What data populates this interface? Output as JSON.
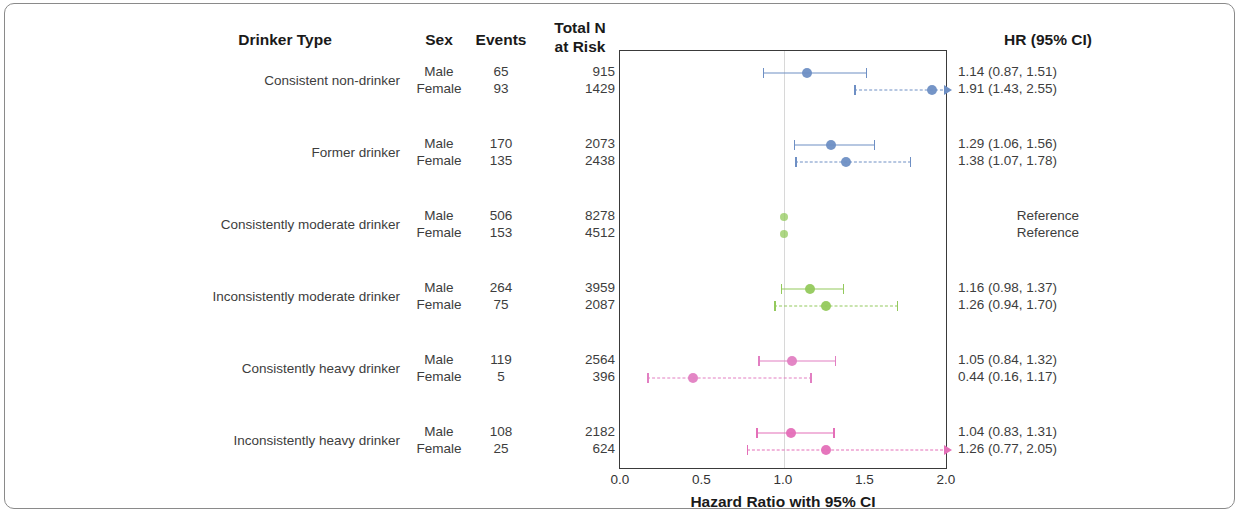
{
  "figure": {
    "axis_title": "Hazard Ratio with 95% CI",
    "headers": {
      "drinker_type": "Drinker Type",
      "sex": "Sex",
      "events": "Events",
      "total_n_line1": "Total N",
      "total_n_line2": "at Risk",
      "hr": "HR (95% CI)"
    },
    "colors": {
      "blue": "#6e8fc4",
      "green": "#93c95c",
      "pink": "#e27fc2",
      "magenta": "#e46fb8",
      "axis": "#3a3a3a",
      "refline": "#d8d8d8",
      "text": "#3d3d3d",
      "header_text": "#1a1a1a"
    }
  },
  "chart_data": {
    "type": "forest",
    "title": "",
    "xlabel": "Hazard Ratio with 95% CI",
    "ylabel": "",
    "xlim": [
      0.0,
      2.0
    ],
    "xticks": [
      0.0,
      0.5,
      1.0,
      1.5,
      2.0
    ],
    "xtick_labels": [
      "0.0",
      "0.5",
      "1.0",
      "1.5",
      "2.0"
    ],
    "reference_line": 1.0,
    "grid": false,
    "legend": "none",
    "columns": [
      "Drinker Type",
      "Sex",
      "Events",
      "Total N at Risk",
      "HR (95% CI)"
    ],
    "groups": [
      {
        "label": "Consistent non-drinker",
        "color": "#6e8fc4",
        "rows": [
          {
            "sex": "Male",
            "events": "65",
            "total_n": "915",
            "hr": 1.14,
            "lo": 0.87,
            "hi": 1.51,
            "hr_text": "1.14 (0.87, 1.51)",
            "style": "solid",
            "reference": false,
            "clipped_right": false
          },
          {
            "sex": "Female",
            "events": "93",
            "total_n": "1429",
            "hr": 1.91,
            "lo": 1.43,
            "hi": 2.55,
            "hr_text": "1.91 (1.43, 2.55)",
            "style": "dashed",
            "reference": false,
            "clipped_right": true
          }
        ]
      },
      {
        "label": "Former drinker",
        "color": "#6e8fc4",
        "rows": [
          {
            "sex": "Male",
            "events": "170",
            "total_n": "2073",
            "hr": 1.29,
            "lo": 1.06,
            "hi": 1.56,
            "hr_text": "1.29 (1.06, 1.56)",
            "style": "solid",
            "reference": false,
            "clipped_right": false
          },
          {
            "sex": "Female",
            "events": "135",
            "total_n": "2438",
            "hr": 1.38,
            "lo": 1.07,
            "hi": 1.78,
            "hr_text": "1.38 (1.07, 1.78)",
            "style": "dashed",
            "reference": false,
            "clipped_right": false
          }
        ]
      },
      {
        "label": "Consistently moderate drinker",
        "color": "#93c95c",
        "rows": [
          {
            "sex": "Male",
            "events": "506",
            "total_n": "8278",
            "hr": 1.0,
            "lo": 1.0,
            "hi": 1.0,
            "hr_text": "Reference",
            "style": "solid",
            "reference": true,
            "clipped_right": false
          },
          {
            "sex": "Female",
            "events": "153",
            "total_n": "4512",
            "hr": 1.0,
            "lo": 1.0,
            "hi": 1.0,
            "hr_text": "Reference",
            "style": "dashed",
            "reference": true,
            "clipped_right": false
          }
        ]
      },
      {
        "label": "Inconsistently moderate drinker",
        "color": "#93c95c",
        "rows": [
          {
            "sex": "Male",
            "events": "264",
            "total_n": "3959",
            "hr": 1.16,
            "lo": 0.98,
            "hi": 1.37,
            "hr_text": "1.16 (0.98, 1.37)",
            "style": "solid",
            "reference": false,
            "clipped_right": false
          },
          {
            "sex": "Female",
            "events": "75",
            "total_n": "2087",
            "hr": 1.26,
            "lo": 0.94,
            "hi": 1.7,
            "hr_text": "1.26 (0.94, 1.70)",
            "style": "dashed",
            "reference": false,
            "clipped_right": false
          }
        ]
      },
      {
        "label": "Consistently heavy drinker",
        "color": "#e27fc2",
        "rows": [
          {
            "sex": "Male",
            "events": "119",
            "total_n": "2564",
            "hr": 1.05,
            "lo": 0.84,
            "hi": 1.32,
            "hr_text": "1.05 (0.84, 1.32)",
            "style": "solid",
            "reference": false,
            "clipped_right": false
          },
          {
            "sex": "Female",
            "events": "5",
            "total_n": "396",
            "hr": 0.44,
            "lo": 0.16,
            "hi": 1.17,
            "hr_text": "0.44 (0.16, 1.17)",
            "style": "dashed",
            "reference": false,
            "clipped_right": false
          }
        ]
      },
      {
        "label": "Inconsistently heavy drinker",
        "color": "#e46fb8",
        "rows": [
          {
            "sex": "Male",
            "events": "108",
            "total_n": "2182",
            "hr": 1.04,
            "lo": 0.83,
            "hi": 1.31,
            "hr_text": "1.04 (0.83, 1.31)",
            "style": "solid",
            "reference": false,
            "clipped_right": false
          },
          {
            "sex": "Female",
            "events": "25",
            "total_n": "624",
            "hr": 1.26,
            "lo": 0.77,
            "hi": 2.05,
            "hr_text": "1.26 (0.77, 2.05)",
            "style": "dashed",
            "reference": false,
            "clipped_right": true
          }
        ]
      }
    ]
  }
}
